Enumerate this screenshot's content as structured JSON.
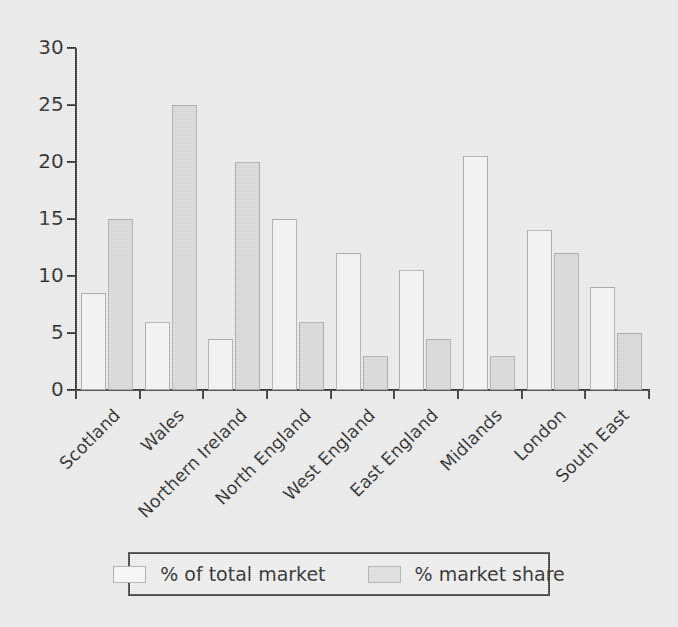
{
  "chart_data": {
    "type": "bar",
    "title": "",
    "subtitle": "",
    "xlabel": "",
    "ylabel": "",
    "ylim": [
      0,
      30
    ],
    "yticks": [
      0,
      5,
      10,
      15,
      20,
      25,
      30
    ],
    "ytick_labels": [
      "0",
      "5",
      "10",
      "15",
      "20",
      "25",
      "30"
    ],
    "grid": false,
    "legend_position": "bottom",
    "categories": [
      "Scotland",
      "Wales",
      "Northern Ireland",
      "North England",
      "West England",
      "East England",
      "Midlands",
      "London",
      "South East"
    ],
    "series": [
      {
        "name": "% of total market",
        "color": "#f3f3f3",
        "values": [
          8.5,
          6,
          4.5,
          15,
          12,
          10.5,
          20.5,
          14,
          9
        ]
      },
      {
        "name": "% market share",
        "color": "#d6d6d6",
        "values": [
          15,
          25,
          20,
          6,
          3,
          4.5,
          3,
          12,
          5
        ]
      }
    ]
  },
  "legend": {
    "items": [
      {
        "label": "% of total market"
      },
      {
        "label": "% market share"
      }
    ]
  }
}
